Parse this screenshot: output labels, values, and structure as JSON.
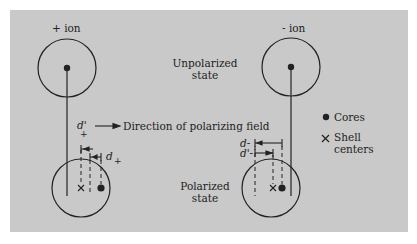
{
  "labels": {
    "plus_ion": "+ ion",
    "minus_ion": "- ion",
    "unpolarized_line1": "Unpolarized",
    "unpolarized_line2": "state",
    "polarized_line1": "Polarized",
    "polarized_line2": "state",
    "direction": "Direction of polarizing field",
    "d_prime_plus": "d'",
    "d_plus": "d",
    "plus_sub": "+",
    "d_minus": "d",
    "d_prime_minus": "d'",
    "minus_sub": "-"
  },
  "legend": {
    "cores_label": "Cores",
    "shell_label_line1": "Shell",
    "shell_label_line2": "centers",
    "cores_symbol": "filled-dot",
    "shell_symbol": "cross"
  },
  "colors": {
    "panel": "#c9c9c9",
    "ink": "#222222"
  }
}
